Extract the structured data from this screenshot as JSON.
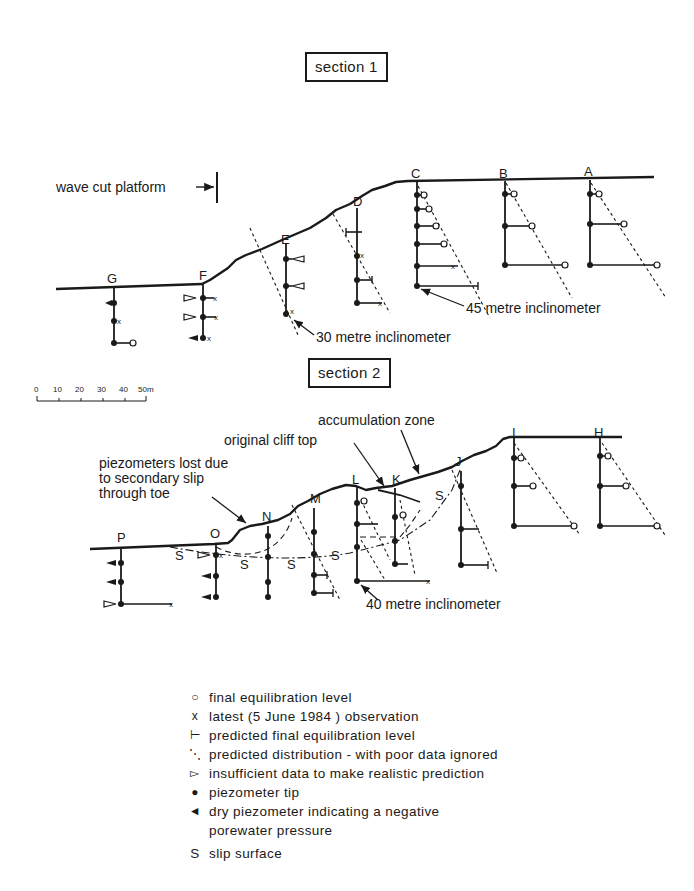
{
  "sections": [
    {
      "title": "section 1",
      "boreholes": [
        "G",
        "F",
        "E",
        "D",
        "C",
        "B",
        "A"
      ],
      "annotations": {
        "wave_cut_platform": "wave cut platform",
        "inclinometer_30": "30 metre inclinometer",
        "inclinometer_45": "45 metre inclinometer"
      }
    },
    {
      "title": "section 2",
      "boreholes": [
        "P",
        "O",
        "N",
        "M",
        "L",
        "K",
        "J",
        "I",
        "H"
      ],
      "annotations": {
        "accumulation_zone": "accumulation zone",
        "original_cliff_top": "original cliff top",
        "piezometers_lost_line1": "piezometers lost due",
        "piezometers_lost_line2": "to secondary slip",
        "piezometers_lost_line3": "through toe",
        "inclinometer_40": "40 metre inclinometer",
        "slip_label": "S"
      }
    }
  ],
  "scale_bar": {
    "ticks": [
      "0",
      "10",
      "20",
      "30",
      "40",
      "50m"
    ],
    "unit": "m"
  },
  "legend": [
    {
      "symbol": "○",
      "icon": "open-circle-icon",
      "label": "final equilibration level"
    },
    {
      "symbol": "x",
      "icon": "cross-icon",
      "label": "latest (5 June 1984 ) observation"
    },
    {
      "symbol": "⊢",
      "icon": "bar-tick-icon",
      "label": "predicted final equilibration level"
    },
    {
      "symbol": "⋱",
      "icon": "dashed-line-icon",
      "label": "predicted distribution - with poor data ignored"
    },
    {
      "symbol": "▻",
      "icon": "open-triangle-icon",
      "label": "insufficient data to make realistic  prediction"
    },
    {
      "symbol": "●",
      "icon": "filled-dot-icon",
      "label": "piezometer tip"
    },
    {
      "symbol": "◄",
      "icon": "filled-triangle-icon",
      "label": "dry piezometer indicating a negative",
      "label2": "porewater pressure"
    },
    {
      "symbol": "S",
      "icon": "slip-letter-icon",
      "label": "slip surface"
    }
  ]
}
